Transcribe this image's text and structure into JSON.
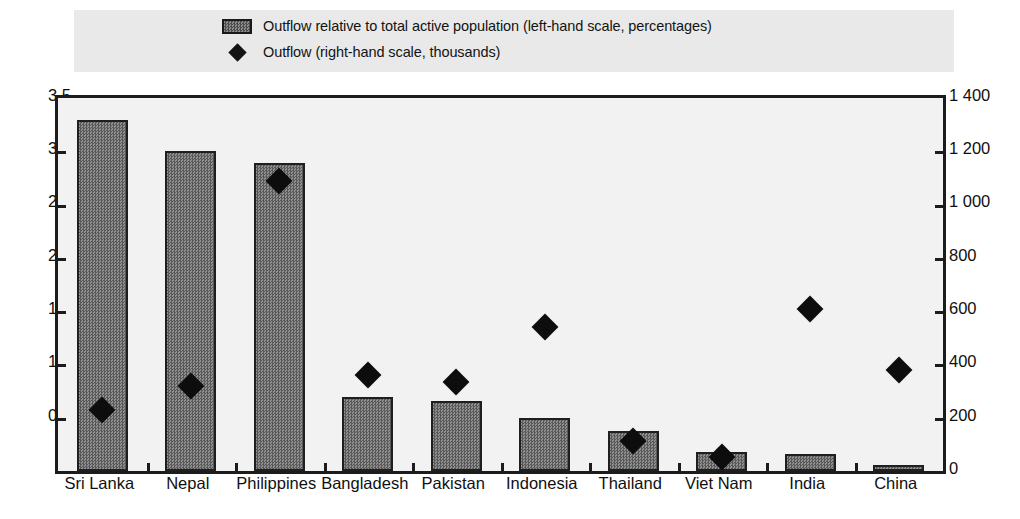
{
  "legend": {
    "items": [
      {
        "icon": "bar-swatch-icon",
        "label": "Outflow relative to total active population (left-hand scale, percentages)"
      },
      {
        "icon": "diamond-marker-icon",
        "label": "Outflow (right-hand scale, thousands)"
      }
    ]
  },
  "axes": {
    "left_ticks": [
      "3.5",
      "3.0",
      "2.5",
      "2.0",
      "1.5",
      "1.0",
      "0.5",
      "0"
    ],
    "right_ticks": [
      "1 400",
      "1 200",
      "1 000",
      "800",
      "600",
      "400",
      "200",
      "0"
    ]
  },
  "chart_data": {
    "type": "bar",
    "title": "",
    "subtitle": "",
    "xlabel": "",
    "ylabel": "Outflow relative to total active population (left-hand scale, percentages)",
    "y2label": "Outflow (right-hand scale, thousands)",
    "ylim": [
      0,
      3.5
    ],
    "y2lim": [
      0,
      1400
    ],
    "ytick_step": 0.5,
    "y2tick_step": 200,
    "grid": false,
    "legend_position": "top",
    "categories": [
      "Sri Lanka",
      "Nepal",
      "Philippines",
      "Bangladesh",
      "Pakistan",
      "Indonesia",
      "Thailand",
      "Viet Nam",
      "India",
      "China"
    ],
    "series": [
      {
        "name": "Outflow relative to total active population (left-hand scale, percentages)",
        "type": "bar",
        "axis": "left",
        "values": [
          3.29,
          3.0,
          2.89,
          0.69,
          0.66,
          0.5,
          0.38,
          0.18,
          0.16,
          0.06
        ]
      },
      {
        "name": "Outflow (right-hand scale, thousands)",
        "type": "scatter",
        "axis": "right",
        "values": [
          265,
          355,
          1125,
          395,
          370,
          575,
          150,
          90,
          645,
          415
        ]
      }
    ]
  }
}
